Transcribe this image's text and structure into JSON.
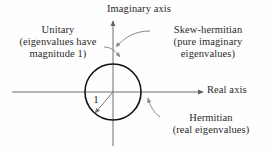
{
  "figure": {
    "background_color": "#fefefe",
    "axis_color": "#6e6e6e",
    "circle_color": "#111111",
    "leader_color": "#8a8a8a",
    "text_color": "#2a2a2a"
  },
  "axes": {
    "imaginary": {
      "label": "Imaginary axis",
      "direction": "up"
    },
    "real": {
      "label": "Real axis",
      "direction": "right"
    },
    "origin": {
      "x": 113,
      "y": 92
    }
  },
  "circle": {
    "name": "unit-circle",
    "radius_px": 28,
    "radius_label": "1"
  },
  "annotations": [
    {
      "id": "unitary",
      "lines": [
        "Unitary",
        "(eigenvalues have",
        "magnitude 1)"
      ],
      "points_to": "unit-circle"
    },
    {
      "id": "skew-hermitian",
      "lines": [
        "Skew-hermitian",
        "(pure imaginary",
        "eigenvalues)"
      ],
      "points_to": "imaginary-axis"
    },
    {
      "id": "hermitian",
      "lines": [
        "Hermitian",
        "(real eigenvalues)"
      ],
      "points_to": "real-axis"
    }
  ]
}
